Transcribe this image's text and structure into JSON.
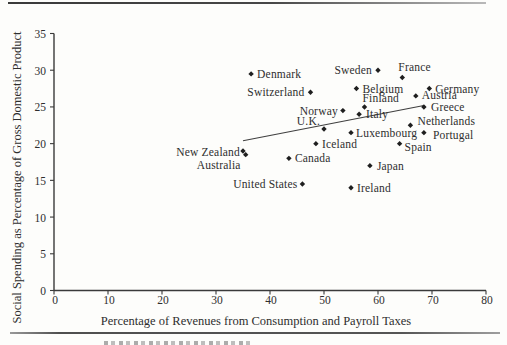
{
  "chart_data": {
    "type": "scatter",
    "title": "",
    "xlabel": "Percentage of Revenues from Consumption and Payroll Taxes",
    "ylabel": "Social Spending as Percentage of Gross Domestic Product",
    "xlim": [
      0,
      80
    ],
    "ylim": [
      0,
      35
    ],
    "x_ticks": [
      0,
      10,
      20,
      30,
      40,
      50,
      60,
      70,
      80
    ],
    "y_ticks": [
      0,
      5,
      10,
      15,
      20,
      25,
      30,
      35
    ],
    "grid": false,
    "legend": "none",
    "marker_shape": "diamond",
    "marker_color": "#1f1f1f",
    "trend_line": {
      "x1": 35,
      "y1": 20.4,
      "x2": 68.5,
      "y2": 25.2
    },
    "points": [
      {
        "name": "Denmark",
        "x": 36.5,
        "y": 29.5,
        "anchor": "start",
        "dx": 6,
        "dy": 4
      },
      {
        "name": "Sweden",
        "x": 60,
        "y": 30,
        "anchor": "end",
        "dx": -6,
        "dy": 4
      },
      {
        "name": "France",
        "x": 64.5,
        "y": 29,
        "anchor": "start",
        "dx": -4,
        "dy": -7
      },
      {
        "name": "Belgium",
        "x": 56,
        "y": 27.5,
        "anchor": "start",
        "dx": 6,
        "dy": 4
      },
      {
        "name": "Germany",
        "x": 69.5,
        "y": 27.5,
        "anchor": "start",
        "dx": 6,
        "dy": 4
      },
      {
        "name": "Switzerland",
        "x": 47.5,
        "y": 27,
        "anchor": "end",
        "dx": -6,
        "dy": 4
      },
      {
        "name": "Austria",
        "x": 67,
        "y": 26.5,
        "anchor": "start",
        "dx": 6,
        "dy": 3
      },
      {
        "name": "Finland",
        "x": 57.5,
        "y": 25,
        "anchor": "start",
        "dx": -2,
        "dy": -5
      },
      {
        "name": "Greece",
        "x": 68.5,
        "y": 25,
        "anchor": "start",
        "dx": 7,
        "dy": 4
      },
      {
        "name": "Norway",
        "x": 53.5,
        "y": 24.5,
        "anchor": "end",
        "dx": -5,
        "dy": 4
      },
      {
        "name": "Italy",
        "x": 56.5,
        "y": 24,
        "anchor": "start",
        "dx": 7,
        "dy": 4
      },
      {
        "name": "Netherlands",
        "x": 66,
        "y": 22.5,
        "anchor": "start",
        "dx": 7,
        "dy": 0
      },
      {
        "name": "U.K.",
        "x": 50,
        "y": 22,
        "anchor": "end",
        "dx": -4,
        "dy": -4
      },
      {
        "name": "Luxembourg",
        "x": 55,
        "y": 21.5,
        "anchor": "start",
        "dx": 5,
        "dy": 4
      },
      {
        "name": "Portugal",
        "x": 68.5,
        "y": 21.5,
        "anchor": "start",
        "dx": 9,
        "dy": 6
      },
      {
        "name": "Spain",
        "x": 64,
        "y": 20,
        "anchor": "start",
        "dx": 5,
        "dy": 7
      },
      {
        "name": "Iceland",
        "x": 48.5,
        "y": 20,
        "anchor": "start",
        "dx": 6,
        "dy": 4
      },
      {
        "name": "New Zealand",
        "x": 35,
        "y": 19,
        "anchor": "end",
        "dx": -3,
        "dy": 5
      },
      {
        "name": "Australia",
        "x": 35.5,
        "y": 18.5,
        "anchor": "end",
        "dx": -5,
        "dy": 14
      },
      {
        "name": "Canada",
        "x": 43.5,
        "y": 18,
        "anchor": "start",
        "dx": 6,
        "dy": 4
      },
      {
        "name": "Japan",
        "x": 58.5,
        "y": 17,
        "anchor": "start",
        "dx": 7,
        "dy": 4
      },
      {
        "name": "United States",
        "x": 46,
        "y": 14.5,
        "anchor": "end",
        "dx": -5,
        "dy": 4
      },
      {
        "name": "Ireland",
        "x": 55,
        "y": 14,
        "anchor": "start",
        "dx": 6,
        "dy": 4
      }
    ]
  }
}
